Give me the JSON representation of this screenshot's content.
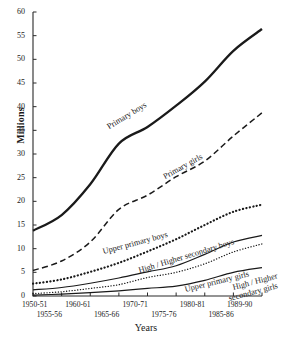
{
  "chart_data": {
    "type": "line",
    "title": "",
    "xlabel": "Years",
    "ylabel": "Millions",
    "ylim": [
      0,
      60
    ],
    "ytick_labels": [
      "0",
      "5",
      "10",
      "15",
      "20",
      "25",
      "30",
      "35",
      "40",
      "45",
      "50",
      "55",
      "60"
    ],
    "yticks": [
      0,
      5,
      10,
      15,
      20,
      25,
      30,
      35,
      40,
      45,
      50,
      55,
      60
    ],
    "grid": false,
    "legend": "inline-curve-labels",
    "categories": [
      "1950-51",
      "1955-56",
      "1960-61",
      "1965-66",
      "1970-71",
      "1975-76",
      "1980-81",
      "1985-86",
      "1989-90"
    ],
    "xtick_row_top": [
      "1950-51",
      "1960-61",
      "1970-71",
      "1980-81",
      "1989-90"
    ],
    "xtick_row_bottom": [
      "1955-56",
      "1965-66",
      "1975-76",
      "1985-86"
    ],
    "series": [
      {
        "name": "Primary boys",
        "style": "solid-thick",
        "values": [
          13.8,
          17.1,
          23.6,
          32.2,
          35.7,
          40.2,
          45.3,
          51.8,
          56.4
        ]
      },
      {
        "name": "Primary girls",
        "style": "dashed",
        "values": [
          5.4,
          7.4,
          11.4,
          18.3,
          21.3,
          25.2,
          28.5,
          33.8,
          38.7
        ]
      },
      {
        "name": "Upper primary boys",
        "style": "dotted-thick",
        "values": [
          2.6,
          3.5,
          5.1,
          7.0,
          9.4,
          12.0,
          15.0,
          17.8,
          19.3
        ]
      },
      {
        "name": "High / Higher secondary boys",
        "style": "solid-thin",
        "values": [
          1.3,
          1.8,
          2.7,
          3.8,
          5.1,
          6.4,
          8.8,
          11.4,
          12.8
        ]
      },
      {
        "name": "Upper primary girls",
        "style": "dotted-fine",
        "values": [
          0.5,
          0.9,
          1.6,
          2.4,
          3.9,
          5.0,
          6.8,
          9.3,
          11.0
        ]
      },
      {
        "name": "High / Higher secondary girls",
        "style": "solid-thin",
        "values": [
          0.2,
          0.4,
          0.7,
          1.1,
          1.6,
          2.1,
          3.3,
          5.0,
          6.0
        ]
      }
    ]
  },
  "curve_labels": [
    {
      "text": "Primary boys"
    },
    {
      "text": "Primary girls"
    },
    {
      "text": "Upper primary boys"
    },
    {
      "text": "High / Higher secondary boys"
    },
    {
      "text": "Upper primary girls"
    },
    {
      "text": "High / Higher"
    },
    {
      "text": "secondary girls"
    }
  ]
}
